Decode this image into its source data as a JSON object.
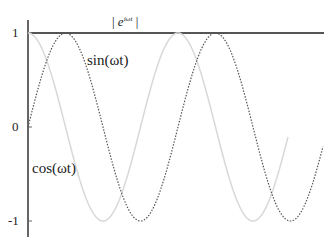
{
  "chart_data": {
    "type": "line",
    "title": "",
    "xlabel": "",
    "ylabel": "",
    "ylim": [
      -1,
      1
    ],
    "yticks": [
      "1",
      "0",
      "-1"
    ],
    "x_range_periods": [
      0,
      1.95
    ],
    "series": [
      {
        "name": "|e^{iωt}|",
        "label": "| e",
        "label_sup": "iωt",
        "label_end": " |",
        "style": "solid",
        "color": "#555555",
        "function": "1",
        "values": [
          1,
          1,
          1,
          1,
          1
        ]
      },
      {
        "name": "sin(ωt)",
        "label": "sin(ωt)",
        "style": "dotted",
        "color": "#555555",
        "function": "sin"
      },
      {
        "name": "cos(ωt)",
        "label": "cos(ωt)",
        "style": "solid",
        "color": "#d8d8d8",
        "function": "cos"
      }
    ],
    "grid": false,
    "legend": "inline labels"
  },
  "labels": {
    "y_one": "1",
    "y_zero": "0",
    "y_neg_one": "-1",
    "abs_left": "| ",
    "abs_e": "e",
    "abs_sup": "iωt",
    "abs_right": " |",
    "sin_label": "sin(ωt)",
    "cos_label": "cos(ωt)"
  }
}
